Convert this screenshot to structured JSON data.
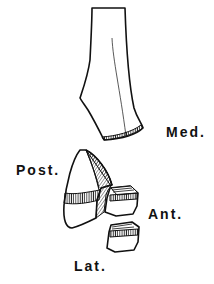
{
  "labels": {
    "medial": "Med.",
    "posterior": "Post.",
    "anterior": "Ant.",
    "lateral": "Lat."
  },
  "colors": {
    "ink": "#111111",
    "background": "#ffffff"
  }
}
